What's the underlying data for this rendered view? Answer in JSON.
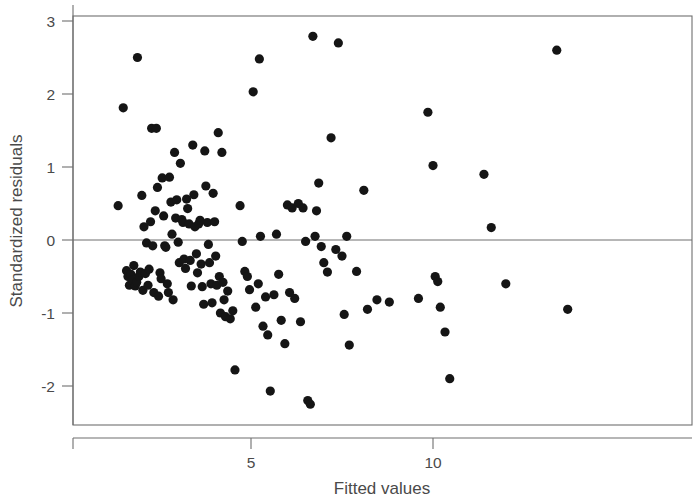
{
  "chart_data": {
    "type": "scatter",
    "title": "",
    "xlabel": "Fitted values",
    "ylabel": "Standardized residuals",
    "xlim": [
      0.75,
      17.75
    ],
    "ylim": [
      -2.45,
      3.16
    ],
    "grid": false,
    "legend": null,
    "xticks": [
      5,
      10
    ],
    "xtick_labels": [
      "5",
      "10"
    ],
    "yticks": [
      -2,
      -1,
      0,
      1,
      2,
      3
    ],
    "ytick_labels": [
      "-2",
      "-1",
      "0",
      "1",
      "2",
      "3"
    ],
    "reference_lines": [
      {
        "orientation": "horizontal",
        "y": 0,
        "style": "solid",
        "color": "#6f6f6f"
      }
    ],
    "marker": {
      "shape": "circle",
      "color": "#151515",
      "size": 4.6
    },
    "n_points": 151,
    "points": [
      [
        1.35,
        0.47
      ],
      [
        1.49,
        1.81
      ],
      [
        1.58,
        -0.42
      ],
      [
        1.62,
        -0.5
      ],
      [
        1.66,
        -0.62
      ],
      [
        1.7,
        -0.47
      ],
      [
        1.74,
        -0.55
      ],
      [
        1.78,
        -0.35
      ],
      [
        1.82,
        -0.63
      ],
      [
        1.86,
        -0.58
      ],
      [
        1.88,
        2.5
      ],
      [
        1.92,
        -0.5
      ],
      [
        1.96,
        -0.44
      ],
      [
        2.0,
        0.61
      ],
      [
        2.03,
        -0.69
      ],
      [
        2.06,
        0.18
      ],
      [
        2.1,
        -0.46
      ],
      [
        2.13,
        -0.04
      ],
      [
        2.17,
        -0.62
      ],
      [
        2.2,
        -0.4
      ],
      [
        2.24,
        0.25
      ],
      [
        2.27,
        1.53
      ],
      [
        2.3,
        -0.08
      ],
      [
        2.33,
        -0.72
      ],
      [
        2.37,
        0.4
      ],
      [
        2.4,
        1.53
      ],
      [
        2.43,
        0.72
      ],
      [
        2.46,
        -0.77
      ],
      [
        2.5,
        -0.45
      ],
      [
        2.53,
        -0.53
      ],
      [
        2.56,
        0.85
      ],
      [
        2.6,
        0.33
      ],
      [
        2.63,
        -0.08
      ],
      [
        2.66,
        -0.1
      ],
      [
        2.7,
        -0.6
      ],
      [
        2.73,
        -0.72
      ],
      [
        2.76,
        0.86
      ],
      [
        2.8,
        0.52
      ],
      [
        2.83,
        0.08
      ],
      [
        2.86,
        -0.82
      ],
      [
        2.9,
        1.2
      ],
      [
        2.93,
        0.3
      ],
      [
        2.96,
        0.55
      ],
      [
        3.0,
        -0.03
      ],
      [
        3.03,
        -0.31
      ],
      [
        3.06,
        1.05
      ],
      [
        3.1,
        0.28
      ],
      [
        3.13,
        0.24
      ],
      [
        3.16,
        -0.26
      ],
      [
        3.2,
        -0.39
      ],
      [
        3.23,
        0.56
      ],
      [
        3.26,
        0.43
      ],
      [
        3.3,
        0.22
      ],
      [
        3.33,
        -0.28
      ],
      [
        3.36,
        -0.63
      ],
      [
        3.4,
        1.3
      ],
      [
        3.43,
        0.62
      ],
      [
        3.46,
        0.18
      ],
      [
        3.5,
        -0.19
      ],
      [
        3.53,
        -0.45
      ],
      [
        3.56,
        0.22
      ],
      [
        3.6,
        0.27
      ],
      [
        3.63,
        -0.33
      ],
      [
        3.66,
        -0.64
      ],
      [
        3.7,
        -0.88
      ],
      [
        3.73,
        1.22
      ],
      [
        3.76,
        0.74
      ],
      [
        3.8,
        0.24
      ],
      [
        3.83,
        -0.06
      ],
      [
        3.86,
        -0.31
      ],
      [
        3.9,
        -0.6
      ],
      [
        3.93,
        -0.86
      ],
      [
        3.96,
        0.64
      ],
      [
        4.0,
        0.25
      ],
      [
        4.03,
        -0.22
      ],
      [
        4.06,
        -0.62
      ],
      [
        4.1,
        1.47
      ],
      [
        4.13,
        -0.5
      ],
      [
        4.16,
        -1.0
      ],
      [
        4.2,
        1.2
      ],
      [
        4.23,
        -0.58
      ],
      [
        4.26,
        -0.82
      ],
      [
        4.3,
        -1.05
      ],
      [
        4.36,
        -0.7
      ],
      [
        4.43,
        -1.08
      ],
      [
        4.5,
        -0.97
      ],
      [
        4.56,
        -1.78
      ],
      [
        4.7,
        0.47
      ],
      [
        4.76,
        -0.02
      ],
      [
        4.83,
        -0.43
      ],
      [
        4.9,
        -0.5
      ],
      [
        4.96,
        -0.68
      ],
      [
        5.06,
        2.03
      ],
      [
        5.13,
        -0.92
      ],
      [
        5.2,
        -0.6
      ],
      [
        5.23,
        2.48
      ],
      [
        5.26,
        0.05
      ],
      [
        5.33,
        -1.18
      ],
      [
        5.4,
        -0.78
      ],
      [
        5.46,
        -1.3
      ],
      [
        5.53,
        -2.07
      ],
      [
        5.63,
        -0.75
      ],
      [
        5.7,
        0.08
      ],
      [
        5.76,
        -0.47
      ],
      [
        5.83,
        -1.1
      ],
      [
        5.93,
        -1.42
      ],
      [
        6.0,
        0.48
      ],
      [
        6.06,
        -0.72
      ],
      [
        6.13,
        0.44
      ],
      [
        6.2,
        -0.8
      ],
      [
        6.3,
        0.5
      ],
      [
        6.36,
        -1.12
      ],
      [
        6.43,
        0.44
      ],
      [
        6.5,
        -0.02
      ],
      [
        6.56,
        -2.2
      ],
      [
        6.63,
        -2.25
      ],
      [
        6.7,
        2.79
      ],
      [
        6.76,
        0.05
      ],
      [
        6.8,
        0.4
      ],
      [
        6.86,
        0.78
      ],
      [
        6.93,
        -0.09
      ],
      [
        7.0,
        -0.31
      ],
      [
        7.1,
        -0.44
      ],
      [
        7.2,
        1.4
      ],
      [
        7.33,
        -0.13
      ],
      [
        7.4,
        2.7
      ],
      [
        7.5,
        -0.22
      ],
      [
        7.56,
        -1.02
      ],
      [
        7.63,
        0.05
      ],
      [
        7.7,
        -1.44
      ],
      [
        7.9,
        -0.43
      ],
      [
        8.1,
        0.68
      ],
      [
        8.2,
        -0.95
      ],
      [
        8.46,
        -0.82
      ],
      [
        8.8,
        -0.85
      ],
      [
        9.6,
        -0.8
      ],
      [
        9.86,
        1.75
      ],
      [
        10.0,
        1.02
      ],
      [
        10.06,
        -0.5
      ],
      [
        10.13,
        -0.57
      ],
      [
        10.2,
        -0.92
      ],
      [
        10.33,
        -1.26
      ],
      [
        10.46,
        -1.9
      ],
      [
        11.4,
        0.9
      ],
      [
        11.6,
        0.17
      ],
      [
        12.0,
        -0.6
      ],
      [
        13.4,
        2.6
      ],
      [
        13.7,
        -0.95
      ]
    ]
  },
  "axes": {
    "y_axis_title": "Standardized residuals",
    "x_axis_title": "Fitted values"
  }
}
